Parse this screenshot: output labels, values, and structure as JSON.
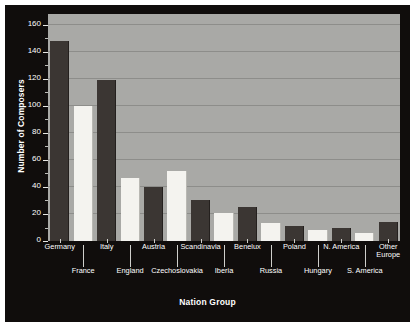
{
  "chart_data": {
    "type": "bar",
    "title": "",
    "xlabel": "Nation Group",
    "ylabel": "Number of Composers",
    "ylim": [
      0,
      168
    ],
    "ytick_values": [
      0,
      20,
      40,
      60,
      80,
      100,
      120,
      140,
      160
    ],
    "ytick_labels": [
      "0",
      "20",
      "40",
      "60",
      "80",
      "100",
      "120",
      "140",
      "160"
    ],
    "yminor_values": [
      10,
      30,
      50,
      70,
      90,
      110,
      130,
      150
    ],
    "grid": true,
    "grid_axis": "y",
    "legend": "none",
    "bar_colors": {
      "dark": "#3b3633",
      "light": "#f4f3ef"
    },
    "plot_background": "#a9a9a6",
    "panel_background": "#100d0c",
    "categories": [
      "Germany",
      "France",
      "Italy",
      "England",
      "Austria",
      "Czechoslovakia",
      "Scandinavia",
      "Iberia",
      "Benelux",
      "Russia",
      "Poland",
      "Hungary",
      "N. America",
      "S. America",
      "Other Europe"
    ],
    "bars": [
      {
        "label": "Germany",
        "label2": "",
        "value": 148,
        "shade": "dark",
        "row": 1
      },
      {
        "label": "France",
        "label2": "",
        "value": 100,
        "shade": "light",
        "row": 2
      },
      {
        "label": "Italy",
        "label2": "",
        "value": 119,
        "shade": "dark",
        "row": 1
      },
      {
        "label": "England",
        "label2": "",
        "value": 47,
        "shade": "light",
        "row": 2
      },
      {
        "label": "Austria",
        "label2": "",
        "value": 40,
        "shade": "dark",
        "row": 1
      },
      {
        "label": "Czechoslovakia",
        "label2": "",
        "value": 52,
        "shade": "light",
        "row": 2
      },
      {
        "label": "Scandinavia",
        "label2": "",
        "value": 30,
        "shade": "dark",
        "row": 1
      },
      {
        "label": "Iberia",
        "label2": "",
        "value": 21,
        "shade": "light",
        "row": 2
      },
      {
        "label": "Benelux",
        "label2": "",
        "value": 25,
        "shade": "dark",
        "row": 1
      },
      {
        "label": "Russia",
        "label2": "",
        "value": 13,
        "shade": "light",
        "row": 2
      },
      {
        "label": "Poland",
        "label2": "",
        "value": 11,
        "shade": "dark",
        "row": 1
      },
      {
        "label": "Hungary",
        "label2": "",
        "value": 8,
        "shade": "light",
        "row": 2
      },
      {
        "label": "N. America",
        "label2": "",
        "value": 10,
        "shade": "dark",
        "row": 1
      },
      {
        "label": "S. America",
        "label2": "",
        "value": 6,
        "shade": "light",
        "row": 2
      },
      {
        "label": "Other",
        "label2": "Europe",
        "value": 14,
        "shade": "dark",
        "row": 1
      }
    ]
  }
}
